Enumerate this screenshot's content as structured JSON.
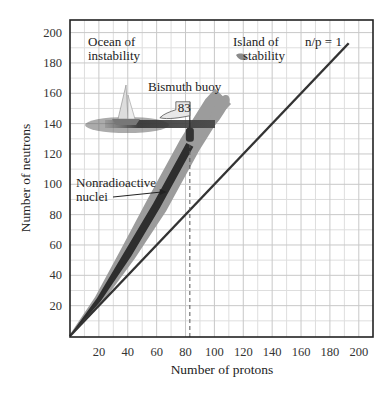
{
  "chart_data": {
    "type": "line",
    "title": "",
    "xlabel": "Number of protons",
    "ylabel": "Number of neutrons",
    "xlim": [
      0,
      210
    ],
    "ylim": [
      0,
      210
    ],
    "x_ticks": [
      20,
      40,
      60,
      80,
      100,
      120,
      140,
      160,
      180,
      200
    ],
    "y_ticks": [
      20,
      40,
      60,
      80,
      100,
      120,
      140,
      160,
      180,
      200
    ],
    "grid": true,
    "grid_minor_step": 10,
    "series": [
      {
        "name": "n/p = 1",
        "kind": "line",
        "color": "#333333",
        "points": [
          [
            0,
            0
          ],
          [
            193,
            193
          ]
        ]
      },
      {
        "name": "Band of stability (radioactive nuclei)",
        "kind": "band",
        "color": "#9a9a9a",
        "center": [
          [
            0,
            0
          ],
          [
            20,
            24
          ],
          [
            40,
            54
          ],
          [
            60,
            86
          ],
          [
            83,
            126
          ],
          [
            100,
            152
          ],
          [
            106,
            158
          ]
        ]
      },
      {
        "name": "Nonradioactive nuclei",
        "kind": "band",
        "color": "#3a3a3a",
        "center": [
          [
            0,
            0
          ],
          [
            20,
            24
          ],
          [
            40,
            54
          ],
          [
            60,
            86
          ],
          [
            83,
            126
          ]
        ]
      },
      {
        "name": "Bismuth cutoff",
        "kind": "vline-dashed",
        "color": "#555555",
        "x": 83,
        "y_range": [
          0,
          126
        ]
      }
    ],
    "annotations": [
      {
        "text_line1": "Ocean of",
        "text_line2": "instability",
        "at": [
          12,
          198
        ]
      },
      {
        "text_line1": "Island of",
        "text_line2": "stability",
        "at": [
          117,
          198
        ]
      },
      {
        "text": "n/p = 1",
        "at": [
          167,
          198
        ]
      },
      {
        "text": "Bismuth buoy",
        "at": [
          54,
          169
        ]
      },
      {
        "text": "83",
        "at": [
          83,
          154
        ]
      },
      {
        "text_line1": "Nonradioactive",
        "text_line2": "nuclei",
        "at": [
          4,
          106
        ]
      }
    ],
    "legend": "none"
  }
}
